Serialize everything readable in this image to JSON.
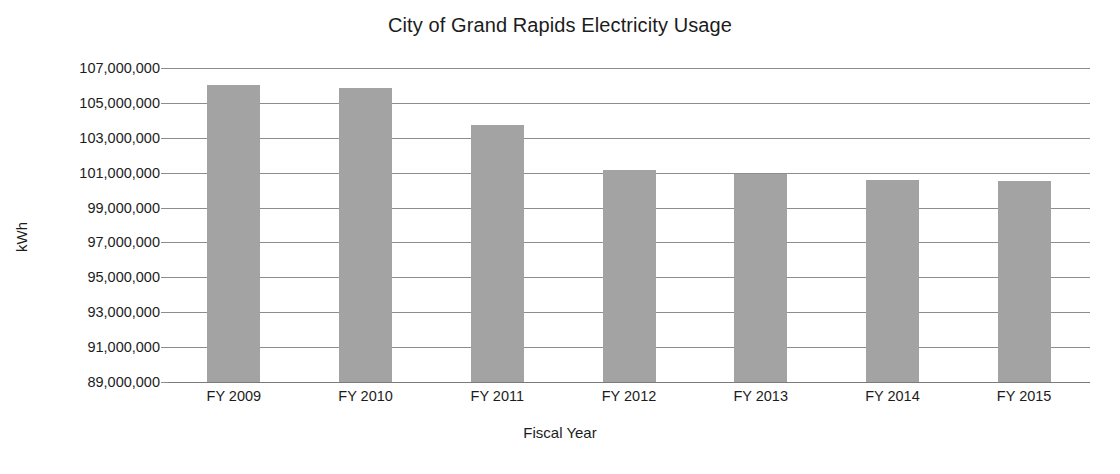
{
  "chart_data": {
    "type": "bar",
    "title": "City of Grand Rapids Electricity Usage",
    "xlabel": "Fiscal Year",
    "ylabel": "kWh",
    "categories": [
      "FY 2009",
      "FY 2010",
      "FY 2011",
      "FY 2012",
      "FY 2013",
      "FY 2014",
      "FY 2015"
    ],
    "values": [
      106000000,
      105850000,
      103750000,
      101150000,
      100950000,
      100600000,
      100500000
    ],
    "ylim": [
      89000000,
      107000000
    ],
    "ytick_step": 2000000,
    "ytick_labels": [
      "107,000,000",
      "105,000,000",
      "103,000,000",
      "101,000,000",
      "99,000,000",
      "97,000,000",
      "95,000,000",
      "93,000,000",
      "91,000,000",
      "89,000,000"
    ],
    "ytick_values": [
      107000000,
      105000000,
      103000000,
      101000000,
      99000000,
      97000000,
      95000000,
      93000000,
      91000000,
      89000000
    ],
    "grid": true,
    "legend": "none",
    "bar_color": "#a3a3a3",
    "grid_color": "#8d8d8d",
    "background_color": "#ffffff",
    "text_color": "#1c1c1c"
  }
}
